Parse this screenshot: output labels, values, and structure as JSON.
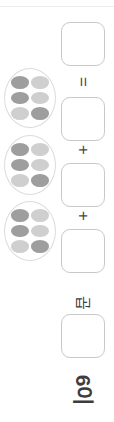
{
  "page": {
    "orientation": "rotated-90",
    "background_color": "#ffffff",
    "width": 114,
    "height": 422
  },
  "divider": {
    "name": "top-rule",
    "color": "#ececed"
  },
  "palette": {
    "egg_dark": "#9e9e9e",
    "egg_light": "#cfcfcf",
    "shell_stroke": "#dcdcdc",
    "box_stroke": "#c9c9c9",
    "text": "#3d3d3d"
  },
  "egg_clusters": [
    {
      "id": "cluster-1",
      "count": 6,
      "top": 68,
      "eggs": [
        "dark",
        "light",
        "dark",
        "light",
        "light",
        "dark"
      ]
    },
    {
      "id": "cluster-2",
      "count": 6,
      "top": 135,
      "eggs": [
        "dark",
        "light",
        "dark",
        "light",
        "light",
        "dark"
      ]
    },
    {
      "id": "cluster-3",
      "count": 6,
      "top": 201,
      "eggs": [
        "dark",
        "light",
        "dark",
        "light",
        "light",
        "dark"
      ]
    }
  ],
  "answer_boxes": [
    {
      "id": "answer-box-total",
      "value": "",
      "top": 22
    },
    {
      "id": "answer-box-1",
      "value": "",
      "top": 97
    },
    {
      "id": "answer-box-2",
      "value": "",
      "top": 163
    },
    {
      "id": "answer-box-3",
      "value": "",
      "top": 229
    },
    {
      "id": "answer-box-product",
      "value": "",
      "top": 314
    }
  ],
  "operators": [
    {
      "id": "equals-operator",
      "symbol": "=",
      "top": 74
    },
    {
      "id": "plus-operator-1",
      "symbol": "+",
      "top": 142
    },
    {
      "id": "plus-operator-2",
      "symbol": "+",
      "top": 208
    }
  ],
  "labels": {
    "multiply_word": "곱",
    "multiplicand": "6이"
  }
}
